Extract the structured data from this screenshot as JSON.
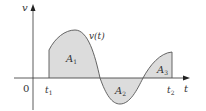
{
  "figure": {
    "y_axis_label": "v",
    "x_axis_label": "t",
    "origin_label": "0",
    "curve_label": "v(t)",
    "t1_label": "t",
    "t1_sub": "1",
    "t2_label": "t",
    "t2_sub": "2",
    "regions": [
      {
        "label": "A",
        "sub": "1"
      },
      {
        "label": "A",
        "sub": "2"
      },
      {
        "label": "A",
        "sub": "3"
      }
    ],
    "colors": {
      "fill": "#dcdcdc",
      "stroke": "#555555",
      "axis": "#333333"
    }
  }
}
